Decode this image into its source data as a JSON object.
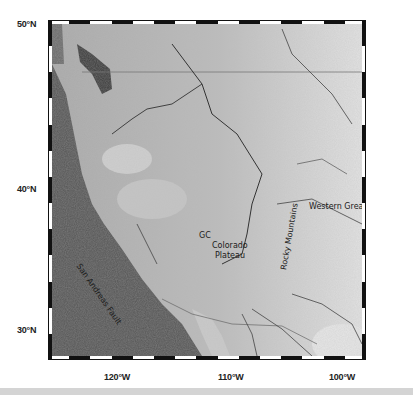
{
  "map": {
    "lat_labels": [
      "50°N",
      "40°N",
      "30°N"
    ],
    "lon_labels": [
      "120°W",
      "110°W",
      "100°W"
    ],
    "features": {
      "san_andreas": "San Andreas Fault",
      "gc": "GC",
      "colorado_line1": "Colorado",
      "colorado_line2": "Plateau",
      "rocky": "Rocky Mountains",
      "plains": "Western Great Plains"
    },
    "colors": {
      "ocean": "#4a4a4a",
      "land": "#bdbdbd",
      "plains": "#dcdcdc",
      "rivers": "#3a3a3a",
      "frame_dark": "#111111",
      "frame_light": "#ffffff"
    }
  }
}
